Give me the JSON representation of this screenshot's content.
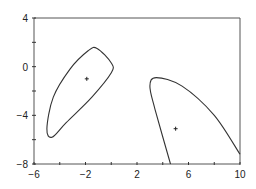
{
  "chart_data": {
    "type": "line",
    "title": "",
    "xlabel": "",
    "ylabel": "",
    "xlim": [
      -6,
      10
    ],
    "ylim": [
      -8,
      4
    ],
    "grid": false,
    "legend": null,
    "x_tick_labels": [
      "-6",
      "-2",
      "2",
      "6",
      "10"
    ],
    "x_ticks_minor": [
      -4,
      0,
      4,
      8
    ],
    "y_tick_labels": [
      "4",
      "0",
      "-4",
      "-8"
    ],
    "y_ticks_minor": [
      2,
      -2,
      -6
    ],
    "series": [
      {
        "name": "contour-1",
        "kind": "closed-contour",
        "center": {
          "x": -1.9,
          "y": -1.0
        },
        "points": [
          [
            -1.1,
            1.5
          ],
          [
            0.0,
            0.3
          ],
          [
            0.0,
            -0.5
          ],
          [
            -1.5,
            -2.5
          ],
          [
            -3.5,
            -4.6
          ],
          [
            -4.6,
            -5.8
          ],
          [
            -5.0,
            -5.1
          ],
          [
            -4.5,
            -2.5
          ],
          [
            -3.2,
            -0.2
          ],
          [
            -1.8,
            1.3
          ]
        ]
      },
      {
        "name": "contour-2",
        "kind": "open-contour",
        "center": {
          "x": 5.0,
          "y": -5.1
        },
        "points": [
          [
            4.6,
            -8.0
          ],
          [
            3.4,
            -3.5
          ],
          [
            3.0,
            -1.6
          ],
          [
            3.5,
            -0.9
          ],
          [
            5.5,
            -1.6
          ],
          [
            8.0,
            -4.0
          ],
          [
            10.0,
            -7.2
          ]
        ]
      }
    ]
  }
}
